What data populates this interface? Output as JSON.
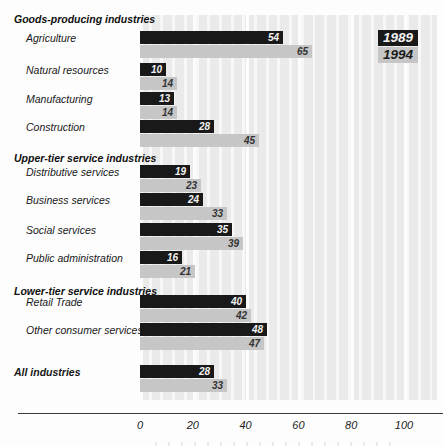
{
  "legend": {
    "items": [
      {
        "label": "1989",
        "bg": "#191919",
        "color": "#f4f4f4"
      },
      {
        "label": "1994",
        "bg": "#c6c6c6",
        "color": "#1a1a1a"
      }
    ]
  },
  "axis": {
    "tick_labels": [
      "0",
      "20",
      "40",
      "60",
      "80",
      "100"
    ],
    "tick_values": [
      0,
      20,
      40,
      60,
      80,
      100
    ]
  },
  "colors": {
    "series_1989": "#191919",
    "series_1994": "#c6c6c6",
    "plot_background": "#eaeaea",
    "grid_stripe": "#f7f7f7"
  },
  "chart_data": {
    "type": "bar",
    "orientation": "horizontal",
    "series_names": [
      "1989",
      "1994"
    ],
    "xlim": [
      0,
      112
    ],
    "x_ticks": [
      0,
      20,
      40,
      60,
      80,
      100
    ],
    "grid": "vertical stripes",
    "legend_position": "top-right",
    "groups": [
      {
        "header": "Goods-producing industries",
        "rows": [
          {
            "label": "Agriculture",
            "values": [
              54,
              65
            ]
          },
          {
            "label": "Natural resources",
            "values": [
              10,
              14
            ]
          },
          {
            "label": "Manufacturing",
            "values": [
              13,
              14
            ]
          },
          {
            "label": "Construction",
            "values": [
              28,
              45
            ]
          }
        ]
      },
      {
        "header": "Upper-tier service industries",
        "rows": [
          {
            "label": "Distributive services",
            "values": [
              19,
              23
            ]
          },
          {
            "label": "Business services",
            "values": [
              24,
              33
            ]
          },
          {
            "label": "Social services",
            "values": [
              35,
              39
            ]
          },
          {
            "label": "Public administration",
            "values": [
              16,
              21
            ]
          }
        ]
      },
      {
        "header": "Lower-tier service industries",
        "rows": [
          {
            "label": "Retail Trade",
            "values": [
              40,
              42
            ]
          },
          {
            "label": "Other consumer services",
            "values": [
              48,
              47
            ]
          }
        ]
      },
      {
        "header": null,
        "rows": [
          {
            "label": "All industries",
            "values": [
              28,
              33
            ],
            "bold": true
          }
        ]
      }
    ]
  }
}
